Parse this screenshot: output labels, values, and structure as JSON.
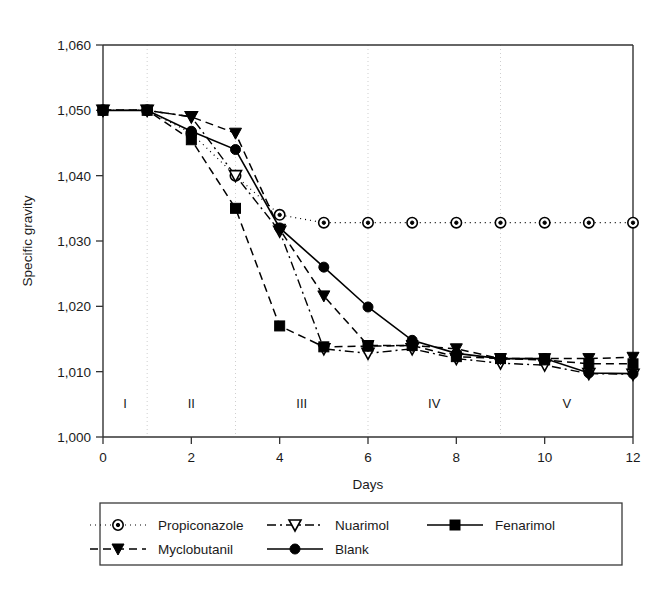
{
  "chart_data": {
    "type": "line",
    "title": "",
    "xlabel": "Days",
    "ylabel": "Specific gravity",
    "xlim": [
      0,
      12
    ],
    "ylim": [
      1000,
      1060
    ],
    "x_ticks": [
      0,
      2,
      4,
      6,
      8,
      10,
      12
    ],
    "x_tick_labels": [
      "0",
      "2",
      "4",
      "6",
      "8",
      "10",
      "12"
    ],
    "y_ticks": [
      1000,
      1010,
      1020,
      1030,
      1040,
      1050,
      1060
    ],
    "y_tick_labels": [
      "1,000",
      "1,010",
      "1,020",
      "1,030",
      "1,040",
      "1,050",
      "1,060"
    ],
    "grid": "vertical-dotted",
    "gridline_x": [
      1,
      3,
      6,
      9
    ],
    "legend_position": "below-plot",
    "x": [
      0,
      1,
      2,
      3,
      4,
      5,
      6,
      7,
      8,
      9,
      10,
      11,
      12
    ],
    "series": [
      {
        "name": "Propiconazole",
        "marker": "circle-dot",
        "linestyle": "dotted",
        "color": "#000000",
        "values": [
          1050.0,
          1050.0,
          1046.5,
          1040.0,
          1034.0,
          1032.8,
          1032.8,
          1032.8,
          1032.8,
          1032.8,
          1032.8,
          1032.8,
          1032.8
        ]
      },
      {
        "name": "Nuarimol",
        "marker": "triangle-down-open",
        "linestyle": "dash-dot",
        "color": "#000000",
        "values": [
          1050.0,
          1050.0,
          1049.0,
          1040.0,
          1031.5,
          1013.5,
          1012.8,
          1013.5,
          1012.0,
          1011.3,
          1011.0,
          1009.7,
          1009.6
        ]
      },
      {
        "name": "Fenarimol",
        "marker": "square-filled",
        "linestyle": "dashed",
        "color": "#000000",
        "values": [
          1050.0,
          1050.0,
          1045.5,
          1035.0,
          1017.0,
          1013.8,
          1013.9,
          1014.0,
          1012.3,
          1012.0,
          1011.8,
          1011.2,
          1011.2
        ]
      },
      {
        "name": "Myclobutanil",
        "marker": "triangle-down-filled",
        "linestyle": "dashed",
        "color": "#000000",
        "values": [
          1050.0,
          1050.0,
          1049.0,
          1046.5,
          1031.8,
          1021.6,
          1014.0,
          1014.0,
          1013.5,
          1012.0,
          1012.0,
          1012.0,
          1012.2
        ]
      },
      {
        "name": "Blank",
        "marker": "circle-filled",
        "linestyle": "solid",
        "color": "#000000",
        "values": [
          1050.0,
          1050.0,
          1046.8,
          1044.0,
          1032.0,
          1026.0,
          1019.9,
          1014.8,
          1012.8,
          1012.0,
          1012.0,
          1009.8,
          1009.7
        ]
      }
    ],
    "annotations": [
      {
        "label": "I",
        "x": 0.5,
        "y": 1004.5
      },
      {
        "label": "II",
        "x": 2.0,
        "y": 1004.5
      },
      {
        "label": "III",
        "x": 4.5,
        "y": 1004.5
      },
      {
        "label": "IV",
        "x": 7.5,
        "y": 1004.5
      },
      {
        "label": "V",
        "x": 10.5,
        "y": 1004.5
      }
    ],
    "legend_entries": [
      {
        "label": "Propiconazole",
        "marker": "circle-dot",
        "linestyle": "dotted"
      },
      {
        "label": "Nuarimol",
        "marker": "triangle-down-open",
        "linestyle": "dash-dot"
      },
      {
        "label": "Fenarimol",
        "marker": "square-filled",
        "linestyle": "solid-short"
      },
      {
        "label": "Myclobutanil",
        "marker": "triangle-down-filled",
        "linestyle": "dashed"
      },
      {
        "label": "Blank",
        "marker": "circle-filled",
        "linestyle": "solid"
      }
    ]
  }
}
